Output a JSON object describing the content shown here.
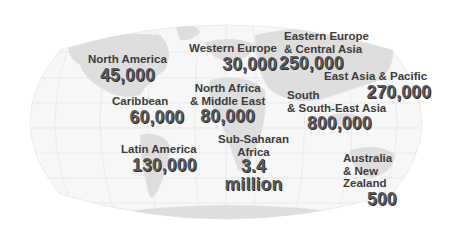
{
  "map": {
    "projection": "world-map-oval-graticule",
    "background_color": "#ffffff",
    "land_color": "#dcdcdc",
    "text_color": "#3c3c3c",
    "value_color": "#5a5a5a"
  },
  "regions": [
    {
      "id": "north-america",
      "label": [
        "North America"
      ],
      "value": "45,000"
    },
    {
      "id": "caribbean",
      "label": [
        "Caribbean"
      ],
      "value": "60,000"
    },
    {
      "id": "latin-america",
      "label": [
        "Latin America"
      ],
      "value": "130,000"
    },
    {
      "id": "western-europe",
      "label": [
        "Western Europe"
      ],
      "value": "30,000"
    },
    {
      "id": "eastern-europe-central-asia",
      "label": [
        "Eastern Europe",
        "& Central Asia"
      ],
      "value": "250,000"
    },
    {
      "id": "north-africa-middle-east",
      "label": [
        "North Africa",
        "& Middle East"
      ],
      "value": "80,000"
    },
    {
      "id": "sub-saharan-africa",
      "label": [
        "Sub-Saharan",
        "Africa"
      ],
      "value": [
        "3.4",
        "million"
      ]
    },
    {
      "id": "east-asia-pacific",
      "label": [
        "East Asia & Pacific"
      ],
      "value": "270,000"
    },
    {
      "id": "south-south-east-asia",
      "label": [
        "South",
        "& South-East Asia"
      ],
      "value": "800,000"
    },
    {
      "id": "australia-new-zealand",
      "label": [
        "Australia",
        "& New",
        "Zealand"
      ],
      "value": "500"
    }
  ]
}
